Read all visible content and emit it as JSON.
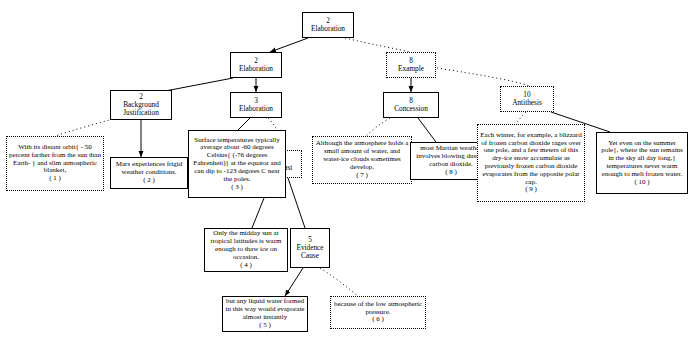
{
  "diagram": {
    "nodes": [
      {
        "id": "n-root",
        "num": "2",
        "label": "Elaboration"
      },
      {
        "id": "n-elab2",
        "num": "2",
        "label": "Elaboration"
      },
      {
        "id": "n-example8",
        "num": "8",
        "label": "Example"
      },
      {
        "id": "n-bgjust",
        "num": "2",
        "label": "Background\nJustification"
      },
      {
        "id": "n-elab3",
        "num": "3",
        "label": "Elaboration"
      },
      {
        "id": "n-concess",
        "num": "8",
        "label": "Concession"
      },
      {
        "id": "n-antith",
        "num": "10",
        "label": "Antithesis"
      },
      {
        "id": "n-contrast",
        "num": "4 5",
        "label": "Contrast"
      },
      {
        "id": "n-evidence",
        "num": "5",
        "label": "Evidence\nCause"
      }
    ],
    "leaves": [
      {
        "id": "l1",
        "text": "With its distant orbit{ - 50 percent farther from the sun than Earth- } and slim atmospheric blanket,",
        "index": "( 1 )",
        "style": "dotted"
      },
      {
        "id": "l2",
        "text": "Mars experiences frigid weather conditions.",
        "index": "( 2 )",
        "style": "solid"
      },
      {
        "id": "l3",
        "text": "Surface temperatures typically average about -60 degrees Celsius{ (-76 degrees Fahrenheit)} at the equator and can dip to -123 degrees C near the poles.",
        "index": "( 3 )",
        "style": "solid"
      },
      {
        "id": "l4",
        "text": "Only the midday sun at tropical latitudes is warm enough to thaw ice on occasion.",
        "index": "( 4 )",
        "style": "solid"
      },
      {
        "id": "l5",
        "text": "but any liquid water formed in this way would evaporate almost instantly",
        "index": "( 5 )",
        "style": "solid"
      },
      {
        "id": "l6",
        "text": "because of the low atmospheric pressure.",
        "index": "( 6 )",
        "style": "dotted"
      },
      {
        "id": "l7",
        "text": "Although the atmosphere holds a small amount of water, and water-ice clouds sometimes develop.",
        "index": "( 7 )",
        "style": "dotted"
      },
      {
        "id": "l8",
        "text": "most Martian weather involves blowing dust or carbon dioxide.",
        "index": "( 8 )",
        "style": "solid"
      },
      {
        "id": "l9",
        "text": "Each winter, for example, a blizzard of frozen carbon dioxide rages over one pole, and a few meters of this dry-ice snow accumulate as previously frozen carbon dioxide evaporates from the opposite polar cap.",
        "index": "( 9 )",
        "style": "dotted"
      },
      {
        "id": "l10",
        "text": "Yet even on the summer pole{, where the sun remains in the sky all day long,} temperatures never warm enough to melt frozen water.",
        "index": "( 10 )",
        "style": "solid"
      }
    ],
    "colors": {
      "line": "#000000",
      "text": "#000000",
      "background": "#ffffff"
    }
  }
}
